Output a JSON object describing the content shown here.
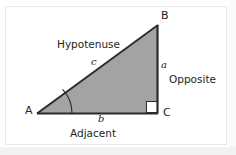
{
  "figure": {
    "type": "right-triangle-diagram",
    "colors": {
      "fill": "#a3a3a3",
      "stroke": "#2b2b2b",
      "text": "#231f20",
      "frame": "#e8e8e8",
      "background": "#ffffff",
      "page_shade": "#f2f2f2",
      "right_angle_fill": "#ffffff"
    },
    "vertices": [
      {
        "name": "A",
        "label": "A",
        "x": 38,
        "y": 113
      },
      {
        "name": "B",
        "label": "B",
        "x": 158,
        "y": 26
      },
      {
        "name": "C",
        "label": "C",
        "x": 158,
        "y": 113
      }
    ],
    "sides": [
      {
        "name": "hypotenuse",
        "short_label": "c",
        "word_label": "Hypotenuse",
        "from": "A",
        "to": "B"
      },
      {
        "name": "opposite",
        "short_label": "a",
        "word_label": "Opposite",
        "from": "B",
        "to": "C"
      },
      {
        "name": "adjacent",
        "short_label": "b",
        "word_label": "Adjacent",
        "from": "A",
        "to": "C"
      }
    ],
    "markers": {
      "angle_arc": {
        "at_vertex": "A",
        "radius": 34
      },
      "right_angle": {
        "at_vertex": "C",
        "size": 11
      }
    },
    "labels": {
      "vertex_a": "A",
      "vertex_b": "B",
      "vertex_c": "C",
      "side_a": "a",
      "side_b": "b",
      "side_c": "c",
      "hypotenuse": "Hypotenuse",
      "opposite": "Opposite",
      "adjacent": "Adjacent"
    }
  }
}
